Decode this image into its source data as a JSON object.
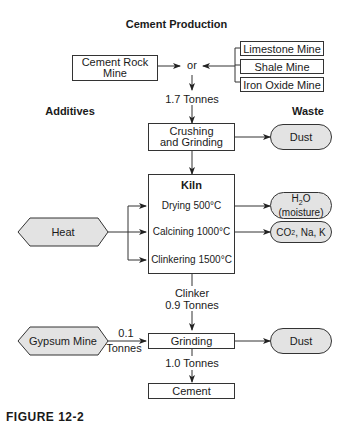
{
  "title": "Cement Production",
  "sections": {
    "additives": "Additives",
    "waste": "Waste"
  },
  "sources": {
    "cement_rock": "Cement Rock\nMine",
    "limestone": "Limestone Mine",
    "shale": "Shale Mine",
    "iron_oxide": "Iron Oxide Mine",
    "or": "or"
  },
  "flows": {
    "raw": "1.7 Tonnes",
    "clinker_label": "Clinker",
    "clinker": "0.9 Tonnes",
    "gypsum_amount": "0.1",
    "gypsum_unit": "Tonnes",
    "final": "1.0 Tonnes"
  },
  "processes": {
    "crushing": "Crushing\nand Grinding",
    "kiln": "Kiln",
    "drying": "Drying 500°C",
    "calcining": "Calcining 1000°C",
    "clinkering": "Clinkering 1500°C",
    "grinding": "Grinding",
    "cement": "Cement"
  },
  "additives": {
    "heat": "Heat",
    "gypsum": "Gypsum Mine"
  },
  "waste": {
    "dust1": "Dust",
    "h2o_formula": "H",
    "h2o_sub": "2",
    "h2o_o": "O",
    "h2o_note": "(moisture)",
    "co2_c": "CO",
    "co2_sub": "2",
    "co2_rest": ", Na, K",
    "dust2": "Dust"
  },
  "caption": "FIGURE 12-2",
  "colors": {
    "line": "#333333",
    "fill": "#e3e3e3",
    "caption": "#1f4e8c"
  }
}
